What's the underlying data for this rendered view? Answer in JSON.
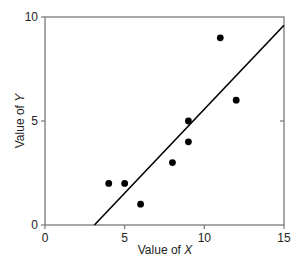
{
  "chart_data": {
    "type": "scatter",
    "title": "",
    "xlabel": "Value of X",
    "ylabel": "Value of Y",
    "xlabel_parts": {
      "prefix": "Value of ",
      "var": "X"
    },
    "ylabel_parts": {
      "prefix": "Value of ",
      "var": "Y"
    },
    "xlim": [
      0,
      15
    ],
    "ylim": [
      0,
      10
    ],
    "xticks": [
      0,
      5,
      10,
      15
    ],
    "yticks": [
      0,
      5,
      10
    ],
    "grid": false,
    "legend": null,
    "series": [
      {
        "name": "observations",
        "marker": "filled-circle",
        "color": "#000000",
        "points": [
          {
            "x": 4,
            "y": 2
          },
          {
            "x": 5,
            "y": 2
          },
          {
            "x": 6,
            "y": 1
          },
          {
            "x": 8,
            "y": 3
          },
          {
            "x": 9,
            "y": 4
          },
          {
            "x": 9,
            "y": 5
          },
          {
            "x": 11,
            "y": 9
          },
          {
            "x": 12,
            "y": 6
          }
        ]
      },
      {
        "name": "regression-line",
        "type": "line",
        "color": "#000000",
        "points": [
          {
            "x": 3.1,
            "y": 0
          },
          {
            "x": 15,
            "y": 9.6
          }
        ]
      }
    ]
  },
  "colors": {
    "axis": "#7a7a7a",
    "data": "#000000",
    "background": "#ffffff"
  }
}
